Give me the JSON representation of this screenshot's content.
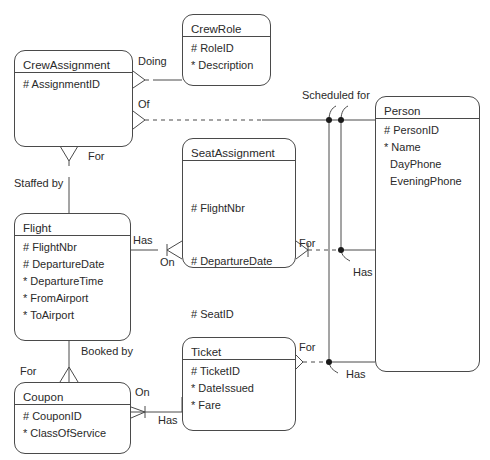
{
  "entities": {
    "crew_role": {
      "name": "CrewRole",
      "attributes": [
        "# RoleID",
        "* Description"
      ]
    },
    "crew_assignment": {
      "name": "CrewAssignment",
      "attributes": [
        "# AssignmentID"
      ]
    },
    "seat_assignment": {
      "name": "SeatAssignment",
      "attributes": [
        "# FlightNbr",
        "# DepartureDate",
        "# SeatID",
        "  PersonID"
      ]
    },
    "person": {
      "name": "Person",
      "attributes": [
        "# PersonID",
        "* Name",
        "  DayPhone",
        "  EveningPhone"
      ]
    },
    "flight": {
      "name": "Flight",
      "attributes": [
        "# FlightNbr",
        "# DepartureDate",
        "* DepartureTime",
        "* FromAirport",
        "* ToAirport"
      ]
    },
    "ticket": {
      "name": "Ticket",
      "attributes": [
        "# TicketID",
        "* DateIssued",
        "* Fare"
      ]
    },
    "coupon": {
      "name": "Coupon",
      "attributes": [
        "# CouponID",
        "* ClassOfService"
      ]
    }
  },
  "relationship_labels": {
    "doing": "Doing",
    "of": "Of",
    "for_crew": "For",
    "staffed_by": "Staffed by",
    "scheduled_for": "Scheduled for",
    "has_flight": "Has",
    "on_seat": "On",
    "for_seat": "For",
    "has_person_seat": "Has",
    "booked_by": "Booked by",
    "for_coupon": "For",
    "on_coupon": "On",
    "has_ticket": "Has",
    "for_ticket": "For",
    "has_person_ticket": "Has"
  },
  "colors": {
    "line": "#4a4a4a",
    "text": "#2a2a2a",
    "background": "#ffffff"
  }
}
